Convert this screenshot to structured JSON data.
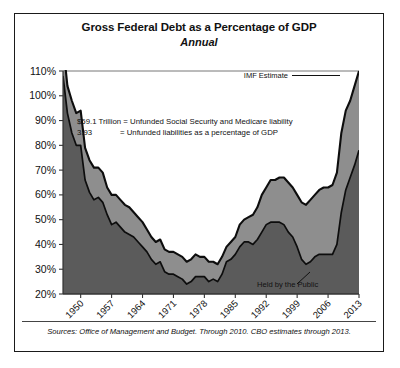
{
  "chart_data": {
    "type": "area",
    "title": "Gross Federal Debt as a Percentage of GDP",
    "subtitle": "Annual",
    "xlabel": "",
    "ylabel": "",
    "ylim": [
      20,
      110
    ],
    "xlim": [
      1946,
      2013
    ],
    "ytick_labels": [
      "110%",
      "100%",
      "90%",
      "80%",
      "70%",
      "60%",
      "50%",
      "40%",
      "30%",
      "20%"
    ],
    "ytick_values": [
      110,
      100,
      90,
      80,
      70,
      60,
      50,
      40,
      30,
      20
    ],
    "xtick_labels": [
      "1950",
      "1957",
      "1964",
      "1971",
      "1978",
      "1985",
      "1992",
      "1999",
      "2006",
      "2013"
    ],
    "xtick_values": [
      1950,
      1957,
      1964,
      1971,
      1978,
      1985,
      1992,
      1999,
      2006,
      2013
    ],
    "grid": false,
    "legend_position": "inline-annotation",
    "series": [
      {
        "name": "Gross Federal Debt",
        "color": "#8e8e8e",
        "x": [
          1946,
          1947,
          1948,
          1949,
          1950,
          1951,
          1952,
          1953,
          1954,
          1955,
          1956,
          1957,
          1958,
          1959,
          1960,
          1961,
          1962,
          1963,
          1964,
          1965,
          1966,
          1967,
          1968,
          1969,
          1970,
          1971,
          1972,
          1973,
          1974,
          1975,
          1976,
          1977,
          1978,
          1979,
          1980,
          1981,
          1982,
          1983,
          1984,
          1985,
          1986,
          1987,
          1988,
          1989,
          1990,
          1991,
          1992,
          1993,
          1994,
          1995,
          1996,
          1997,
          1998,
          1999,
          2000,
          2001,
          2002,
          2003,
          2004,
          2005,
          2006,
          2007,
          2008,
          2009,
          2010,
          2011,
          2012,
          2013
        ],
        "values": [
          121,
          104,
          98,
          93,
          94,
          79,
          74,
          71,
          71,
          69,
          63,
          60,
          60,
          58,
          56,
          55,
          53,
          51,
          49,
          46,
          43,
          41,
          42,
          38,
          37,
          37,
          36,
          35,
          33,
          34,
          36,
          35,
          35,
          33,
          33,
          32,
          35,
          39,
          41,
          43,
          48,
          50,
          51,
          52,
          55,
          60,
          63,
          66,
          66,
          67,
          67,
          65,
          63,
          60,
          57,
          56,
          58,
          60,
          62,
          63,
          63,
          64,
          69,
          85,
          94,
          98,
          104,
          110
        ]
      },
      {
        "name": "Held by the Public",
        "color": "#5b5b5b",
        "x": [
          1946,
          1947,
          1948,
          1949,
          1950,
          1951,
          1952,
          1953,
          1954,
          1955,
          1956,
          1957,
          1958,
          1959,
          1960,
          1961,
          1962,
          1963,
          1964,
          1965,
          1966,
          1967,
          1968,
          1969,
          1970,
          1971,
          1972,
          1973,
          1974,
          1975,
          1976,
          1977,
          1978,
          1979,
          1980,
          1981,
          1982,
          1983,
          1984,
          1985,
          1986,
          1987,
          1988,
          1989,
          1990,
          1991,
          1992,
          1993,
          1994,
          1995,
          1996,
          1997,
          1998,
          1999,
          2000,
          2001,
          2002,
          2003,
          2004,
          2005,
          2006,
          2007,
          2008,
          2009,
          2010,
          2011,
          2012,
          2013
        ],
        "values": [
          108,
          93,
          85,
          80,
          80,
          66,
          61,
          58,
          59,
          57,
          52,
          48,
          49,
          47,
          45,
          44,
          43,
          41,
          39,
          37,
          34,
          32,
          33,
          29,
          28,
          28,
          27,
          26,
          24,
          25,
          27,
          27,
          27,
          25,
          26,
          25,
          28,
          33,
          34,
          36,
          39,
          41,
          41,
          40,
          42,
          45,
          48,
          49,
          49,
          49,
          48,
          45,
          43,
          39,
          34,
          32,
          33,
          35,
          36,
          36,
          36,
          36,
          40,
          53,
          62,
          67,
          72,
          78
        ]
      }
    ],
    "annotations": [
      {
        "name": "imf-estimate",
        "text": "IMF Estimate"
      },
      {
        "name": "held-by-public-label",
        "text": "Held by the Public"
      },
      {
        "name": "unfunded-liability-line1",
        "text": "$59.1 Trillion = Unfunded Social Security and Medicare liability"
      },
      {
        "name": "unfunded-liability-line2-value",
        "text": "3.93"
      },
      {
        "name": "unfunded-liability-line2-desc",
        "text": "= Unfunded liabilities as a percentage of GDP"
      }
    ],
    "source_note": "Sources: Office of Management and Budget. Through 2010. CBO estimates through 2013."
  }
}
